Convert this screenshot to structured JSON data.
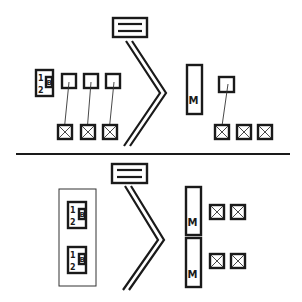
{
  "diagram": {
    "title": "",
    "top_panel": {
      "legend_box": {
        "symbol": "double-line-box"
      },
      "connector": {
        "symbol": "double-chevron"
      },
      "unit_box": {
        "label_1": "1",
        "label_2": "2",
        "label_b": "B"
      },
      "small_boxes": 3,
      "x_boxes_left": 3,
      "m_box": {
        "label": "M"
      },
      "right_small_boxes": 1,
      "x_boxes_right": 3
    },
    "bottom_panel": {
      "legend_box": {
        "symbol": "double-line-box"
      },
      "connector": {
        "symbol": "double-chevron"
      },
      "unit_boxes": [
        {
          "label_1": "1",
          "label_2": "2",
          "label_b": "B"
        },
        {
          "label_1": "1",
          "label_2": "2",
          "label_b": "B"
        }
      ],
      "m_boxes": [
        {
          "label": "M"
        },
        {
          "label": "M"
        }
      ],
      "x_box_rows": [
        2,
        2
      ]
    },
    "colors": {
      "ink": "#1a1a1a",
      "background": "#ffffff"
    }
  }
}
